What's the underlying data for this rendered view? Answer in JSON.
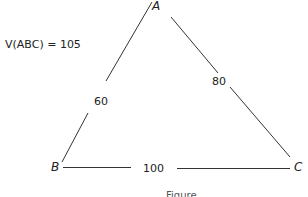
{
  "diagram": {
    "title_expression": "V(ABC) = 105",
    "vertices": {
      "A": {
        "label": "A"
      },
      "B": {
        "label": "B"
      },
      "C": {
        "label": "C"
      }
    },
    "edges": {
      "AB": {
        "label": "60"
      },
      "AC": {
        "label": "80"
      },
      "BC": {
        "label": "100"
      }
    },
    "caption": "Figure"
  },
  "colors": {
    "line": "#333333",
    "text": "#222222",
    "background": "#ffffff"
  }
}
